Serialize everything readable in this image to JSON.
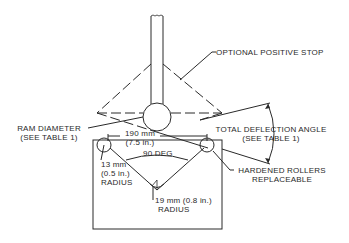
{
  "diagram": {
    "type": "bend-test-fixture",
    "labels": {
      "positive_stop": "OPTIONAL POSITIVE STOP",
      "ram_diameter_line1": "RAM DIAMETER",
      "ram_diameter_line2": "(SEE TABLE 1)",
      "span_mm": "190 mm",
      "span_in": "(7.5 in.)",
      "angle": "90 DEG",
      "roller_radius_line1": "13 mm",
      "roller_radius_line2": "(0.5 in.)",
      "roller_radius_line3": "RADIUS",
      "vee_radius_line1": "19 mm (0.8 in.)",
      "vee_radius_line2": "RADIUS",
      "deflection_line1": "TOTAL DEFLECTION ANGLE",
      "deflection_line2": "(SEE TABLE 1)",
      "rollers_line1": "HARDENED ROLLERS",
      "rollers_line2": "REPLACEABLE"
    },
    "colors": {
      "line": "#2a2a2a",
      "background": "#ffffff"
    }
  }
}
